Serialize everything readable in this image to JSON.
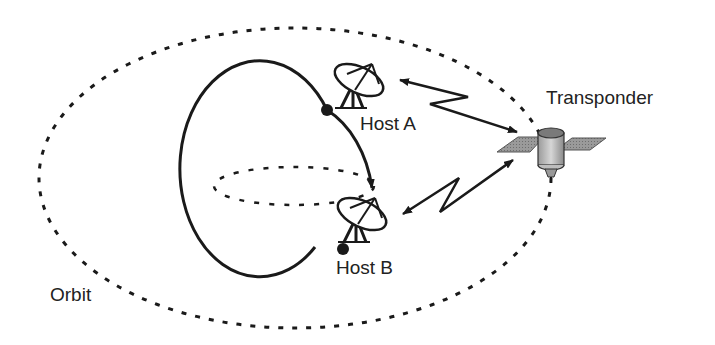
{
  "diagram": {
    "type": "satellite-communication-diagram",
    "labels": {
      "transponder": "Transponder",
      "host_a": "Host A",
      "host_b": "Host B",
      "orbit": "Orbit"
    },
    "nodes": [
      {
        "id": "host_a",
        "label": "Host A",
        "kind": "satellite-dish",
        "position": "upper-right of globe"
      },
      {
        "id": "host_b",
        "label": "Host B",
        "kind": "satellite-dish",
        "position": "lower-right of globe"
      },
      {
        "id": "transponder",
        "label": "Transponder",
        "kind": "satellite",
        "position": "on orbit, right side"
      }
    ],
    "links": [
      {
        "from": "host_a",
        "to": "transponder",
        "style": "lightning-bidirectional-arrow"
      },
      {
        "from": "host_b",
        "to": "transponder",
        "style": "lightning-bidirectional-arrow"
      }
    ],
    "elements": {
      "orbit": "dashed ellipse",
      "earth": "circle with dashed equator",
      "surface_path": "arc from Host A to Host B with arrowhead"
    },
    "colors": {
      "line": "#1a1a1a",
      "panel": "#8c8c8c",
      "body": "#bdbdbd",
      "text": "#222222"
    }
  }
}
